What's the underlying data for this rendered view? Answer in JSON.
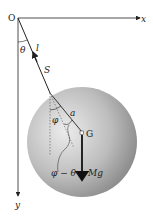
{
  "diagram": {
    "labels": {
      "origin": "O",
      "x_axis": "x",
      "y_axis": "y",
      "string_length": "l",
      "angle_theta": "θ",
      "suspension_point": "S",
      "distance_a": "a",
      "angle_phi": "φ",
      "center_of_mass": "G",
      "angle_phi_minus_theta": "φ − θ",
      "weight_force": "Mg"
    },
    "colors": {
      "sphere_light": "#e6e6e6",
      "sphere_dark": "#8a8a8a",
      "line": "#222222"
    }
  }
}
